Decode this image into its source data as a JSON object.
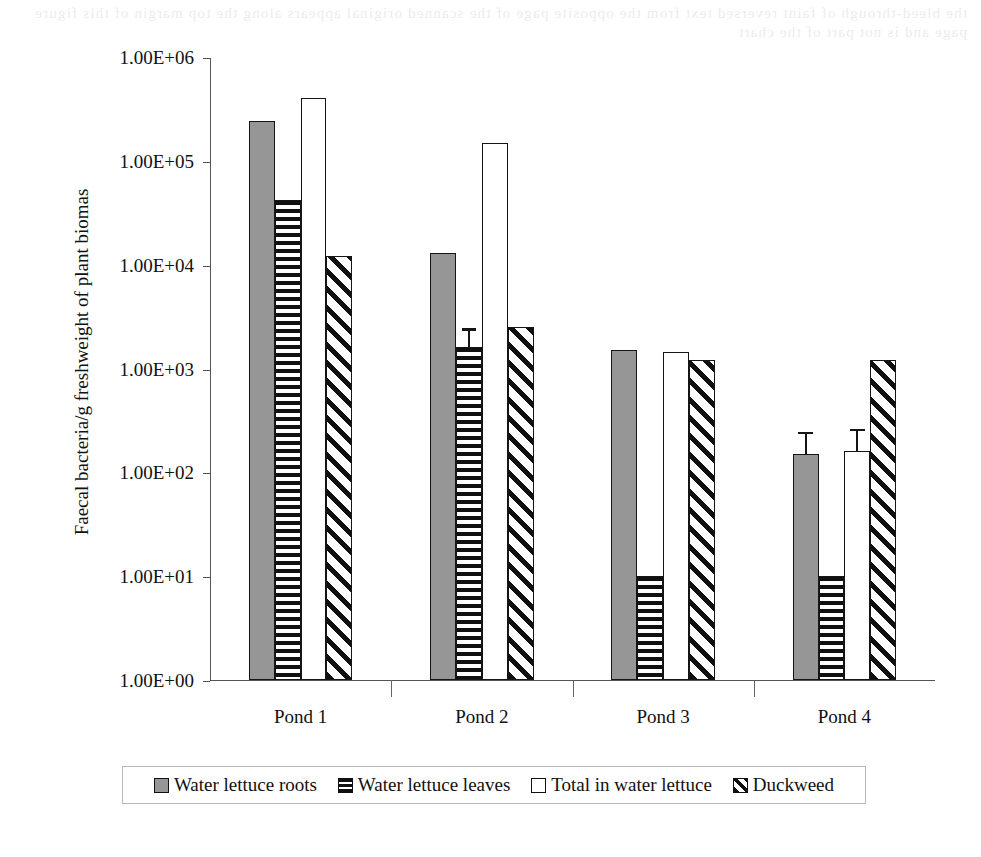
{
  "page": {
    "background_color": "#ffffff",
    "scan_bleed_text": "the bleed-through of faint reversed text from the opposite page of the scanned original appears along the top margin of this figure page and is not part of the chart"
  },
  "chart_data": {
    "type": "bar",
    "title": "",
    "xlabel": "",
    "ylabel": "Faecal bacteria/g freshweight of plant biomas",
    "categories": [
      "Pond 1",
      "Pond 2",
      "Pond 3",
      "Pond 4"
    ],
    "y_scale": "log10",
    "ylim": [
      1,
      1000000
    ],
    "y_tick_values": [
      1,
      10,
      100,
      1000,
      10000,
      100000,
      1000000
    ],
    "y_tick_labels": [
      "1.00E+00",
      "1.00E+01",
      "1.00E+02",
      "1.00E+03",
      "1.00E+04",
      "1.00E+05",
      "1.00E+06"
    ],
    "grid": false,
    "legend_position": "bottom",
    "series": [
      {
        "name": "Water lettuce roots",
        "fill": "solid-gray",
        "color": "#969696",
        "values": [
          240000,
          13000,
          1500,
          150
        ],
        "errors_upper": [
          0,
          0,
          0,
          100
        ]
      },
      {
        "name": "Water lettuce leaves",
        "fill": "horizontal-stripes",
        "color": "#101010",
        "values": [
          42000,
          1600,
          10,
          10
        ],
        "errors_upper": [
          0,
          900,
          0,
          0
        ]
      },
      {
        "name": "Total in water lettuce",
        "fill": "empty-white",
        "color": "#ffffff",
        "values": [
          400000,
          150000,
          1450,
          160
        ],
        "errors_upper": [
          0,
          0,
          0,
          110
        ]
      },
      {
        "name": "Duckweed",
        "fill": "diagonal-stripes",
        "color": "#101010",
        "values": [
          12000,
          2500,
          1200,
          1200
        ],
        "errors_upper": [
          0,
          0,
          0,
          0
        ]
      }
    ]
  },
  "legend": {
    "items": [
      {
        "label": "Water lettuce roots",
        "swatch": "solid-gray"
      },
      {
        "label": "Water lettuce leaves",
        "swatch": "horizontal-stripes"
      },
      {
        "label": "Total in water lettuce",
        "swatch": "empty-white"
      },
      {
        "label": "Duckweed",
        "swatch": "diagonal-stripes"
      }
    ]
  }
}
